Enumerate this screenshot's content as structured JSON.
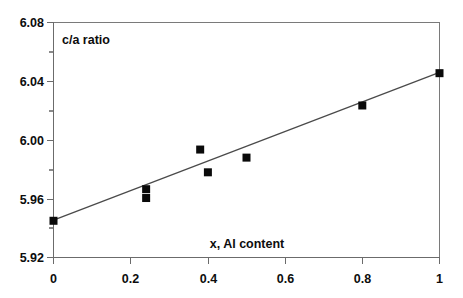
{
  "chart_data": {
    "type": "scatter",
    "title": "",
    "xlabel": "x, Al content",
    "ylabel": "c/a ratio",
    "xlim": [
      0,
      1
    ],
    "ylim": [
      5.92,
      6.08
    ],
    "grid": false,
    "legend": "none",
    "x_ticks": [
      "0",
      "0.2",
      "0.4",
      "0.6",
      "0.8",
      "1"
    ],
    "x_tick_values": [
      0,
      0.2,
      0.4,
      0.6,
      0.8,
      1
    ],
    "y_ticks": [
      "5.92",
      "5.96",
      "6.00",
      "6.04",
      "6.08"
    ],
    "y_tick_values": [
      5.92,
      5.96,
      6.0,
      6.04,
      6.08
    ],
    "y_minor_tick_values": [
      5.94,
      5.98,
      6.02,
      6.06
    ],
    "points": [
      {
        "x": 0.0,
        "y": 5.945
      },
      {
        "x": 0.24,
        "y": 5.9665
      },
      {
        "x": 0.24,
        "y": 5.9605
      },
      {
        "x": 0.38,
        "y": 5.9935
      },
      {
        "x": 0.4,
        "y": 5.978
      },
      {
        "x": 0.5,
        "y": 5.988
      },
      {
        "x": 0.8,
        "y": 6.0235
      },
      {
        "x": 1.0,
        "y": 6.0455
      }
    ],
    "trendline": {
      "x": [
        0.0,
        1.0
      ],
      "y": [
        5.9455,
        6.046
      ]
    },
    "marker_style": "filled-square",
    "marker_size_px": 8,
    "colors": {
      "marker": "#0a0a0a",
      "trendline": "#4a4a4a",
      "axis": "#6b6b6b",
      "frame": "#7a7a7a",
      "text": "#0d0d0d",
      "background": "#ffffff"
    }
  },
  "labels": {
    "y_axis_title": "c/a ratio",
    "x_axis_title": "x, Al content"
  }
}
